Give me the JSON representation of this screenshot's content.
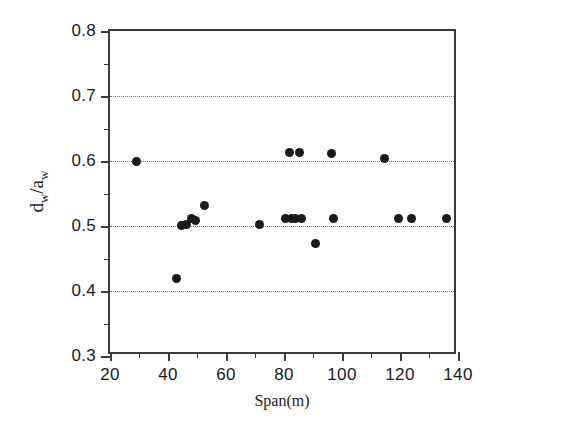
{
  "chart_data": {
    "type": "scatter",
    "title": "",
    "xlabel": "Span(m)",
    "ylabel": "d_w/a_w",
    "ylabel_parts": {
      "num": "d",
      "num_sub": "w",
      "slash": "/",
      "den": "a",
      "den_sub": "w"
    },
    "xlim": [
      20,
      140
    ],
    "ylim": [
      0.3,
      0.8
    ],
    "xticks": [
      20,
      40,
      60,
      80,
      100,
      120,
      140
    ],
    "xtick_labels": [
      "20",
      "40",
      "60",
      "80",
      "100",
      "120",
      "140"
    ],
    "xminor_ticks": [
      30,
      50,
      70,
      90,
      110,
      130
    ],
    "yticks": [
      0.3,
      0.4,
      0.5,
      0.6,
      0.7,
      0.8
    ],
    "ytick_labels": [
      "0.3",
      "0.4",
      "0.5",
      "0.6",
      "0.7",
      "0.8"
    ],
    "yminor_ticks": [
      0.35,
      0.45,
      0.55,
      0.65,
      0.75
    ],
    "grid": "horizontal-dotted",
    "gridlines_y": [
      0.4,
      0.5,
      0.6,
      0.7
    ],
    "legend": "none",
    "marker": "filled-circle",
    "marker_color": "#1a1a1a",
    "points": [
      {
        "x": 29.0,
        "y": 0.6
      },
      {
        "x": 43.0,
        "y": 0.42
      },
      {
        "x": 44.5,
        "y": 0.501
      },
      {
        "x": 46.5,
        "y": 0.503
      },
      {
        "x": 48.0,
        "y": 0.511
      },
      {
        "x": 49.5,
        "y": 0.508
      },
      {
        "x": 52.5,
        "y": 0.531
      },
      {
        "x": 71.5,
        "y": 0.503
      },
      {
        "x": 80.5,
        "y": 0.512
      },
      {
        "x": 82.0,
        "y": 0.613
      },
      {
        "x": 82.5,
        "y": 0.512
      },
      {
        "x": 84.0,
        "y": 0.512
      },
      {
        "x": 85.5,
        "y": 0.613
      },
      {
        "x": 86.0,
        "y": 0.512
      },
      {
        "x": 91.0,
        "y": 0.473
      },
      {
        "x": 96.5,
        "y": 0.612
      },
      {
        "x": 97.0,
        "y": 0.512
      },
      {
        "x": 114.5,
        "y": 0.604
      },
      {
        "x": 119.5,
        "y": 0.512
      },
      {
        "x": 124.0,
        "y": 0.512
      },
      {
        "x": 136.0,
        "y": 0.512
      }
    ]
  },
  "axes": {
    "x_title": "Span(m)",
    "y_title": "d/a"
  }
}
